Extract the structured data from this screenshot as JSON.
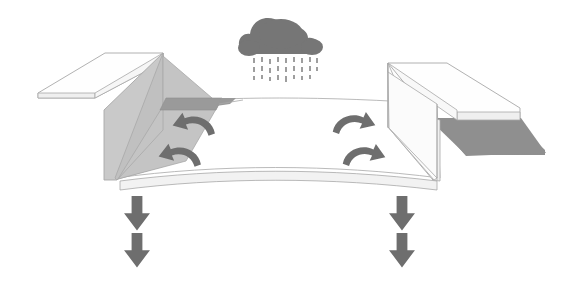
{
  "diagram": {
    "title": "Roof valley rainwater drainage diagram",
    "type": "isometric-architectural-illustration",
    "canvas": {
      "width": 563,
      "height": 290,
      "background": "#ffffff"
    },
    "palette": {
      "background": "#ffffff",
      "outline": "#a8a8a8",
      "roof_face_white": "#fefefe",
      "wall_light_gray": "#c9c9c9",
      "wall_mid_gray": "#bdbdbd",
      "slope_gray": "#c4c4c4",
      "strip_dark_gray": "#9a9a9a",
      "shadow_gray": "#8f8f8f",
      "cloud_gray": "#767676",
      "rain_gray": "#9e9e9e",
      "arrow_gray": "#6e6e6e",
      "down_arrow_gray": "#6e6e6e"
    },
    "elements": {
      "cloud": {
        "name": "rain cloud",
        "color": "#767676",
        "center_x": 283,
        "center_y": 38,
        "width": 76,
        "height": 36
      },
      "rain": {
        "name": "falling rain",
        "color": "#9e9e9e",
        "columns": 9,
        "rows": 3,
        "top": 56,
        "bottom": 84,
        "left": 253,
        "right": 318,
        "dash_length": 5,
        "dash_width": 2
      },
      "left_roof": {
        "name": "left sloped roof plane",
        "fill": "#fefefe",
        "edge_fill": "#e6e6e6"
      },
      "right_roof": {
        "name": "right sloped roof plane",
        "fill": "#fefefe",
        "edge_fill": "#e6e6e6"
      },
      "left_wall": {
        "name": "left vertical wall face",
        "fill": "#c9c9c9"
      },
      "right_wall": {
        "name": "right vertical wall face",
        "fill": "#fdfdfd"
      },
      "valley_floor": {
        "name": "valley gutter floor",
        "fill": "#ffffff"
      },
      "left_slope": {
        "name": "left inner slope",
        "fill": "#c4c4c4"
      },
      "right_slope": {
        "name": "right inner slope",
        "fill": "#fcfcfc"
      },
      "dark_strip": {
        "name": "dark gray flashing strip",
        "fill": "#9a9a9a"
      },
      "ground_shadow": {
        "name": "cast shadow on right",
        "fill": "#8f8f8f"
      }
    },
    "flow_arrows": [
      {
        "id": "left-upper",
        "name": "water flow arrow left upper",
        "direction": "left",
        "x": 185,
        "y": 124,
        "color": "#6e6e6e"
      },
      {
        "id": "left-lower",
        "name": "water flow arrow left lower",
        "direction": "left",
        "x": 172,
        "y": 155,
        "color": "#6e6e6e"
      },
      {
        "id": "right-upper",
        "name": "water flow arrow right upper",
        "direction": "right",
        "x": 362,
        "y": 123,
        "color": "#6e6e6e"
      },
      {
        "id": "right-lower",
        "name": "water flow arrow right lower",
        "direction": "right",
        "x": 372,
        "y": 155,
        "color": "#6e6e6e"
      }
    ],
    "discharge_arrows": [
      {
        "id": "left-1",
        "name": "downspout discharge arrow left upper",
        "x": 137,
        "y": 200,
        "color": "#6e6e6e"
      },
      {
        "id": "left-2",
        "name": "downspout discharge arrow left lower",
        "x": 137,
        "y": 237,
        "color": "#6e6e6e"
      },
      {
        "id": "right-1",
        "name": "downspout discharge arrow right upper",
        "x": 402,
        "y": 200,
        "color": "#6e6e6e"
      },
      {
        "id": "right-2",
        "name": "downspout discharge arrow right lower",
        "x": 402,
        "y": 237,
        "color": "#6e6e6e"
      }
    ]
  }
}
